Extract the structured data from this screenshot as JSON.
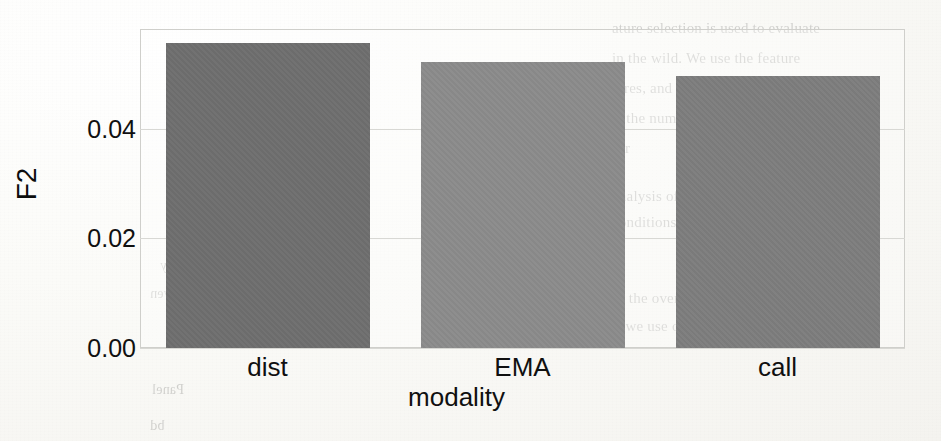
{
  "document": {
    "kind": "scanned-journal-page",
    "ghost_text": [
      {
        "text": "ature selection is used to evaluate",
        "x": 612,
        "y": 20,
        "size": 15,
        "mirrored": false
      },
      {
        "text": "in the wild. We use the feature",
        "x": 612,
        "y": 50,
        "size": 15,
        "mirrored": false
      },
      {
        "text": "tures, and the full feature set",
        "x": 612,
        "y": 80,
        "size": 15,
        "mirrored": false
      },
      {
        "text": "is the number of features selected",
        "x": 612,
        "y": 110,
        "size": 15,
        "mirrored": false
      },
      {
        "text": "for",
        "x": 612,
        "y": 140,
        "size": 15,
        "mirrored": false
      },
      {
        "text": "analysis of the data we collected in each",
        "x": 612,
        "y": 188,
        "size": 15,
        "mirrored": false
      },
      {
        "text": "conditions during",
        "x": 612,
        "y": 214,
        "size": 15,
        "mirrored": false
      },
      {
        "text": "In the overall, there is a trend",
        "x": 612,
        "y": 290,
        "size": 15,
        "mirrored": false
      },
      {
        "text": "if we use only a portion",
        "x": 612,
        "y": 318,
        "size": 15,
        "mirrored": false
      },
      {
        "text": "Panel",
        "x": 152,
        "y": 382,
        "size": 14,
        "mirrored": true
      },
      {
        "text": "bd",
        "x": 150,
        "y": 418,
        "size": 14,
        "mirrored": true
      },
      {
        "text": "ratings were collected in a daily",
        "x": 160,
        "y": 258,
        "size": 14,
        "mirrored": true
      },
      {
        "text": "participants were given",
        "x": 150,
        "y": 286,
        "size": 14,
        "mirrored": true
      }
    ]
  },
  "chart_data": {
    "type": "bar",
    "title": "",
    "xlabel": "modality",
    "ylabel": "F2",
    "categories": [
      "dist",
      "EMA",
      "call"
    ],
    "values": [
      0.0556,
      0.0522,
      0.0496
    ],
    "bar_colors": [
      "#6e6e6e",
      "#8b8b8b",
      "#7d7d7d"
    ],
    "ylim": [
      0.0,
      0.0582
    ],
    "yticks": [
      0.0,
      0.02,
      0.04
    ],
    "ytick_labels": [
      "0.00",
      "0.02",
      "0.04"
    ],
    "grid": true,
    "legend": "none",
    "bar_width_fraction": 0.8
  }
}
